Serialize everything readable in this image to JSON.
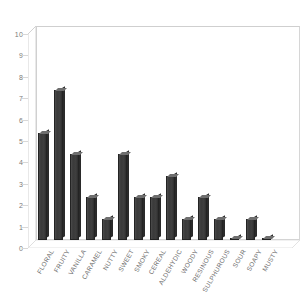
{
  "chart_data": {
    "type": "bar",
    "title": "",
    "xlabel": "",
    "ylabel": "",
    "ylim": [
      0,
      10
    ],
    "grid": false,
    "legend": "none",
    "yticks": [
      0,
      1,
      2,
      3,
      4,
      5,
      6,
      7,
      8,
      9,
      10
    ],
    "ytick_labels": [
      "0",
      "1",
      "2",
      "3",
      "4",
      "5",
      "6",
      "7",
      "8",
      "9",
      "10"
    ],
    "categories": [
      "FLORAL",
      "FRUITY",
      "VANILLA",
      "CARAMEL",
      "NUTTY",
      "SWEET",
      "SMOKY",
      "CEREAL",
      "ALDEHYDIC",
      "WOODY",
      "RESINOUS",
      "SULPHUROUS",
      "SOUR",
      "SOAPY",
      "MUSTY"
    ],
    "values": [
      5,
      7,
      4,
      2,
      1,
      4,
      2,
      2,
      3,
      1,
      2,
      1,
      0.1,
      1,
      0.1
    ],
    "series": [
      {
        "name": "count",
        "values": [
          5,
          7,
          4,
          2,
          1,
          4,
          2,
          2,
          3,
          1,
          2,
          1,
          0.1,
          1,
          0.1
        ]
      }
    ],
    "colors": {
      "bar_face": "#3a3a3a",
      "bar_top": "#6e6e6e",
      "bar_side": "#2a2a2a",
      "bar_outline": "#232323",
      "axis_text": "#7a7a7a",
      "label_text": "#6d6d6d",
      "frame": "#cfcfcf",
      "background": "#ffffff"
    }
  }
}
